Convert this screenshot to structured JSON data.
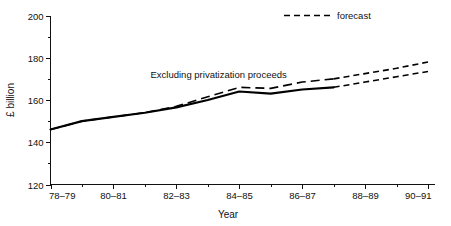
{
  "chart_data": {
    "type": "line",
    "title": "",
    "xlabel": "Year",
    "ylabel": "£ billion",
    "ylim": [
      120,
      200
    ],
    "ytick_labels": [
      "200",
      "180",
      "160",
      "140",
      "120"
    ],
    "ytick_values": [
      200,
      180,
      160,
      140,
      120
    ],
    "yminor_values": [
      190,
      170,
      150,
      130
    ],
    "xtick_labels": [
      "78–79",
      "80–81",
      "82–83",
      "84–85",
      "86–87",
      "88–89",
      "90–91"
    ],
    "xminor_labels": [
      "79–80",
      "81–82",
      "83–84",
      "85–86",
      "87–88",
      "89–90"
    ],
    "x": [
      "78–79",
      "79–80",
      "80–81",
      "81–82",
      "82–83",
      "83–84",
      "84–85",
      "85–86",
      "86–87",
      "87–88",
      "88–89",
      "89–90",
      "90–91"
    ],
    "grid": false,
    "legend_position": "top-right",
    "series": [
      {
        "name": "Excluding privatization proceeds",
        "style": "solid",
        "values": [
          146.0,
          150.0,
          152.0,
          154.0,
          156.5,
          160.0,
          164.0,
          163.0,
          165.0,
          166.0,
          null,
          null,
          null
        ],
        "forecast_values": [
          null,
          null,
          null,
          null,
          null,
          null,
          null,
          null,
          null,
          166.0,
          168.5,
          171.0,
          173.5
        ]
      },
      {
        "name": "Total (including privatization proceeds)",
        "style": "dashed",
        "values": [
          146.0,
          150.0,
          152.0,
          154.0,
          157.0,
          161.5,
          166.0,
          165.5,
          168.5,
          170.0,
          null,
          null,
          null
        ],
        "forecast_values": [
          null,
          null,
          null,
          null,
          null,
          null,
          null,
          null,
          null,
          170.0,
          172.5,
          175.0,
          178.0
        ]
      }
    ],
    "annotations": [
      {
        "text": "Excluding privatization proceeds",
        "x_frac": 0.265,
        "y_value": 172.0
      }
    ],
    "legend": [
      {
        "label": "forecast",
        "style": "dashed"
      }
    ]
  },
  "axes": {
    "y_axis_title": "£ billion",
    "x_axis_title": "Year"
  }
}
